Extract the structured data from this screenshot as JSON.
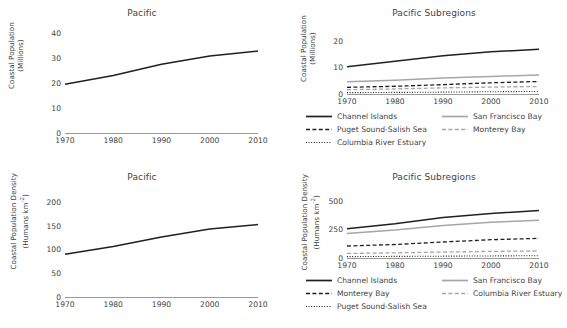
{
  "panels": {
    "top_left": {
      "title": "Pacific",
      "ylabel_line1": "Coastal Population",
      "ylabel_line2": "(Millions)"
    },
    "top_right": {
      "title": "Pacific Subregions",
      "ylabel_line1": "Coastal Population",
      "ylabel_line2": "(Millions)"
    },
    "bottom_left": {
      "title": "Pacific",
      "ylabel_line1": "Coastal Population Density",
      "ylabel_line2": "(Humans km",
      "ylabel_sup": "-2",
      "ylabel_line2_end": ")"
    },
    "bottom_right": {
      "title": "Pacific Subregions",
      "ylabel_line1": "Coastal Population Density",
      "ylabel_line2": "(Humans km",
      "ylabel_sup": "-2",
      "ylabel_line2_end": ")"
    }
  },
  "colors": {
    "line_dark": "#231f20",
    "line_gray": "#a6a6a6",
    "axis": "#9a9a9a",
    "text": "#3f3f3f"
  },
  "chart_data": [
    {
      "id": "pacific-population",
      "type": "line",
      "title": "Pacific",
      "xlabel": "",
      "ylabel": "Coastal Population (Millions)",
      "x": [
        1970,
        1980,
        1990,
        2000,
        2010
      ],
      "xticks": [
        "1970",
        "1980",
        "1990",
        "2000",
        "2010"
      ],
      "yticks": [
        "0",
        "10",
        "20",
        "30",
        "40"
      ],
      "ylim": [
        0,
        40
      ],
      "xlim": [
        1970,
        2010
      ],
      "grid": false,
      "legend": "none",
      "series": [
        {
          "name": "Pacific",
          "style": "solid",
          "color": "#231f20",
          "values": [
            19.5,
            23.0,
            27.5,
            30.8,
            32.8
          ]
        }
      ]
    },
    {
      "id": "pacific-subregions-population",
      "type": "line",
      "title": "Pacific Subregions",
      "xlabel": "",
      "ylabel": "Coastal Population (Millions)",
      "x": [
        1970,
        1980,
        1990,
        2000,
        2010
      ],
      "xticks": [
        "1970",
        "1980",
        "1990",
        "2000",
        "2010"
      ],
      "yticks": [
        "0",
        "10",
        "20"
      ],
      "ylim": [
        0,
        24
      ],
      "xlim": [
        1970,
        2010
      ],
      "grid": false,
      "legend": "below",
      "series": [
        {
          "name": "Channel Islands",
          "style": "solid",
          "color": "#231f20",
          "values": [
            10.2,
            12.3,
            14.3,
            15.8,
            16.8
          ]
        },
        {
          "name": "San Francisco Bay",
          "style": "solid",
          "color": "#a6a6a6",
          "values": [
            4.6,
            5.2,
            6.0,
            6.6,
            7.1
          ]
        },
        {
          "name": "Puget Sound-Salish Sea",
          "style": "dashed",
          "color": "#231f20",
          "values": [
            2.5,
            2.9,
            3.5,
            4.2,
            4.7
          ]
        },
        {
          "name": "Monterey Bay",
          "style": "dashed",
          "color": "#a6a6a6",
          "values": [
            1.6,
            1.9,
            2.3,
            2.6,
            2.8
          ]
        },
        {
          "name": "Columbia River Estuary",
          "style": "dotted",
          "color": "#231f20",
          "values": [
            0.5,
            0.6,
            0.7,
            0.85,
            0.95
          ]
        }
      ]
    },
    {
      "id": "pacific-density",
      "type": "line",
      "title": "Pacific",
      "xlabel": "",
      "ylabel": "Coastal Population Density (Humans km-2)",
      "x": [
        1970,
        1980,
        1990,
        2000,
        2010
      ],
      "xticks": [
        "1970",
        "1980",
        "1990",
        "2000",
        "2010"
      ],
      "yticks": [
        "0",
        "50",
        "100",
        "150",
        "200"
      ],
      "ylim": [
        0,
        210
      ],
      "xlim": [
        1970,
        2010
      ],
      "grid": false,
      "legend": "none",
      "series": [
        {
          "name": "Pacific",
          "style": "solid",
          "color": "#231f20",
          "values": [
            90,
            106,
            126,
            143,
            152
          ]
        }
      ]
    },
    {
      "id": "pacific-subregions-density",
      "type": "line",
      "title": "Pacific Subregions",
      "xlabel": "",
      "ylabel": "Coastal Population Density (Humans km-2)",
      "x": [
        1970,
        1980,
        1990,
        2000,
        2010
      ],
      "xticks": [
        "1970",
        "1980",
        "1990",
        "2000",
        "2010"
      ],
      "yticks": [
        "0",
        "250",
        "500"
      ],
      "ylim": [
        0,
        560
      ],
      "xlim": [
        1970,
        2010
      ],
      "grid": false,
      "legend": "below",
      "series": [
        {
          "name": "Channel Islands",
          "style": "solid",
          "color": "#231f20",
          "values": [
            255,
            300,
            355,
            390,
            415
          ]
        },
        {
          "name": "San Francisco Bay",
          "style": "solid",
          "color": "#a6a6a6",
          "values": [
            215,
            245,
            285,
            312,
            330
          ]
        },
        {
          "name": "Monterey Bay",
          "style": "dashed",
          "color": "#231f20",
          "values": [
            105,
            118,
            140,
            160,
            172
          ]
        },
        {
          "name": "Columbia River Estuary",
          "style": "dashed",
          "color": "#a6a6a6",
          "values": [
            40,
            45,
            52,
            58,
            62
          ]
        },
        {
          "name": "Puget Sound-Salish Sea",
          "style": "dotted",
          "color": "#231f20",
          "values": [
            12,
            14,
            16,
            18,
            20
          ]
        }
      ]
    }
  ],
  "legends": {
    "top_right": [
      {
        "label": "Channel Islands",
        "style": "solid",
        "color": "#231f20"
      },
      {
        "label": "San Francisco Bay",
        "style": "solid",
        "color": "#a6a6a6"
      },
      {
        "label": "Puget Sound-Salish Sea",
        "style": "dashed",
        "color": "#231f20"
      },
      {
        "label": "Monterey Bay",
        "style": "dashed",
        "color": "#a6a6a6"
      },
      {
        "label": "Columbia River Estuary",
        "style": "dotted",
        "color": "#231f20"
      }
    ],
    "bottom_right": [
      {
        "label": "Channel Islands",
        "style": "solid",
        "color": "#231f20"
      },
      {
        "label": "San Francisco Bay",
        "style": "solid",
        "color": "#a6a6a6"
      },
      {
        "label": "Monterey Bay",
        "style": "dashed",
        "color": "#231f20"
      },
      {
        "label": "Columbia River Estuary",
        "style": "dashed",
        "color": "#a6a6a6"
      },
      {
        "label": "Puget Sound-Salish Sea",
        "style": "dotted",
        "color": "#231f20"
      }
    ]
  }
}
